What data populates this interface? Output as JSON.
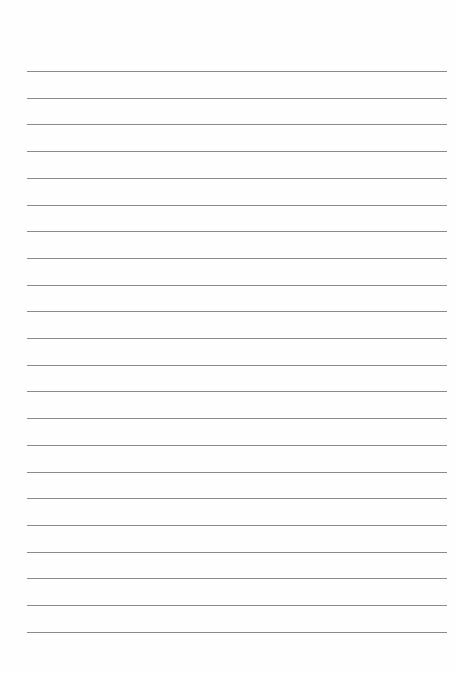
{
  "page": {
    "type": "lined-paper",
    "background_color": "#fefefe",
    "line_color": "#8a8a8a",
    "line_count": 22,
    "first_line_y": 71,
    "line_spacing": 26.7,
    "lines": [
      "",
      "",
      "",
      "",
      "",
      "",
      "",
      "",
      "",
      "",
      "",
      "",
      "",
      "",
      "",
      "",
      "",
      "",
      "",
      "",
      "",
      ""
    ]
  }
}
